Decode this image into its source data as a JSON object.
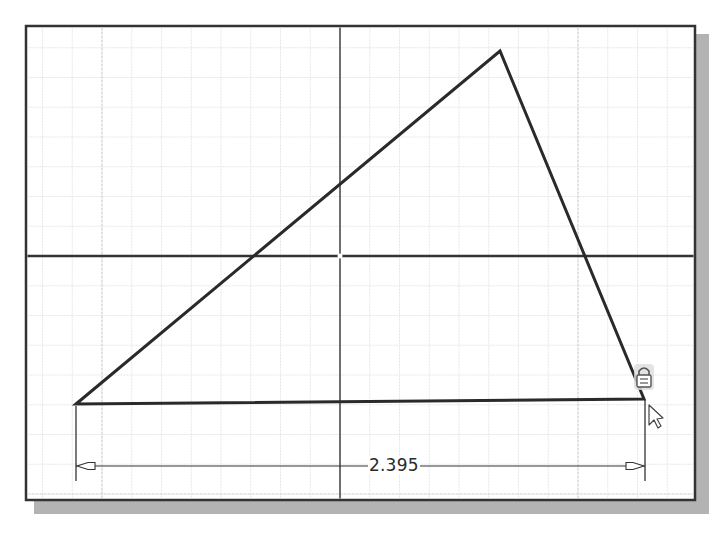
{
  "sketch": {
    "frame": {
      "x": 26,
      "y": 26,
      "width": 669,
      "height": 474,
      "border_color": "#333333",
      "shadow_color": "#b3b3b3"
    },
    "grid": {
      "spacing": 29.75,
      "major_every": 8,
      "origin_x": 340,
      "origin_y": 256,
      "minor_color": "#e6e6e6",
      "major_color": "#d0d0d0"
    },
    "axes": {
      "x_axis_y": 256,
      "y_axis_x": 340,
      "color": "#333333"
    },
    "triangle": {
      "vertices": [
        {
          "name": "bottom-left",
          "x": 76,
          "y": 404
        },
        {
          "name": "apex",
          "x": 500,
          "y": 51
        },
        {
          "name": "bottom-right",
          "x": 644,
          "y": 399
        }
      ],
      "stroke": "#2a2a2a"
    },
    "dimension": {
      "value": "2.395",
      "start_x": 76,
      "end_x": 645,
      "line_y": 466,
      "ext_top": 406,
      "ext_bottom": 481,
      "label_x": 368,
      "label_y": 456
    },
    "constraint_icon": {
      "type": "lock-icon",
      "x": 636,
      "y": 365
    },
    "cursor": {
      "type": "arrow-cursor",
      "x": 649,
      "y": 405
    }
  }
}
